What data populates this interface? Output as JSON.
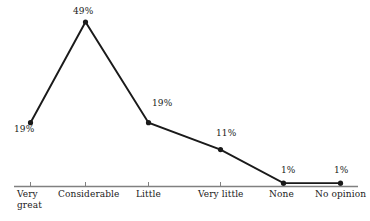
{
  "chart_data": {
    "type": "line",
    "title": "",
    "subtitle": "",
    "xlabel": "",
    "ylabel": "",
    "categories": [
      "Very great",
      "Considerable",
      "Little",
      "Very little",
      "None",
      "No opinion"
    ],
    "category_lines": [
      [
        "Very",
        "great"
      ],
      [
        "Considerable"
      ],
      [
        "Little"
      ],
      [
        "Very little"
      ],
      [
        "None"
      ],
      [
        "No opinion"
      ]
    ],
    "values": [
      19,
      49,
      19,
      11,
      1,
      1
    ],
    "value_labels": [
      "19%",
      "49%",
      "19%",
      "11%",
      "1%",
      "1%"
    ],
    "ylim": [
      0,
      52
    ],
    "grid": false,
    "legend": "none",
    "series": [
      {
        "name": "",
        "values": [
          19,
          49,
          19,
          11,
          1,
          1
        ]
      }
    ],
    "colors": {
      "line": "#1a1a1a",
      "marker": "#1a1a1a",
      "axis": "#808080",
      "text": "#1a1a1a",
      "background": "#ffffff"
    },
    "marker": "circle",
    "axis_ticks": true
  }
}
